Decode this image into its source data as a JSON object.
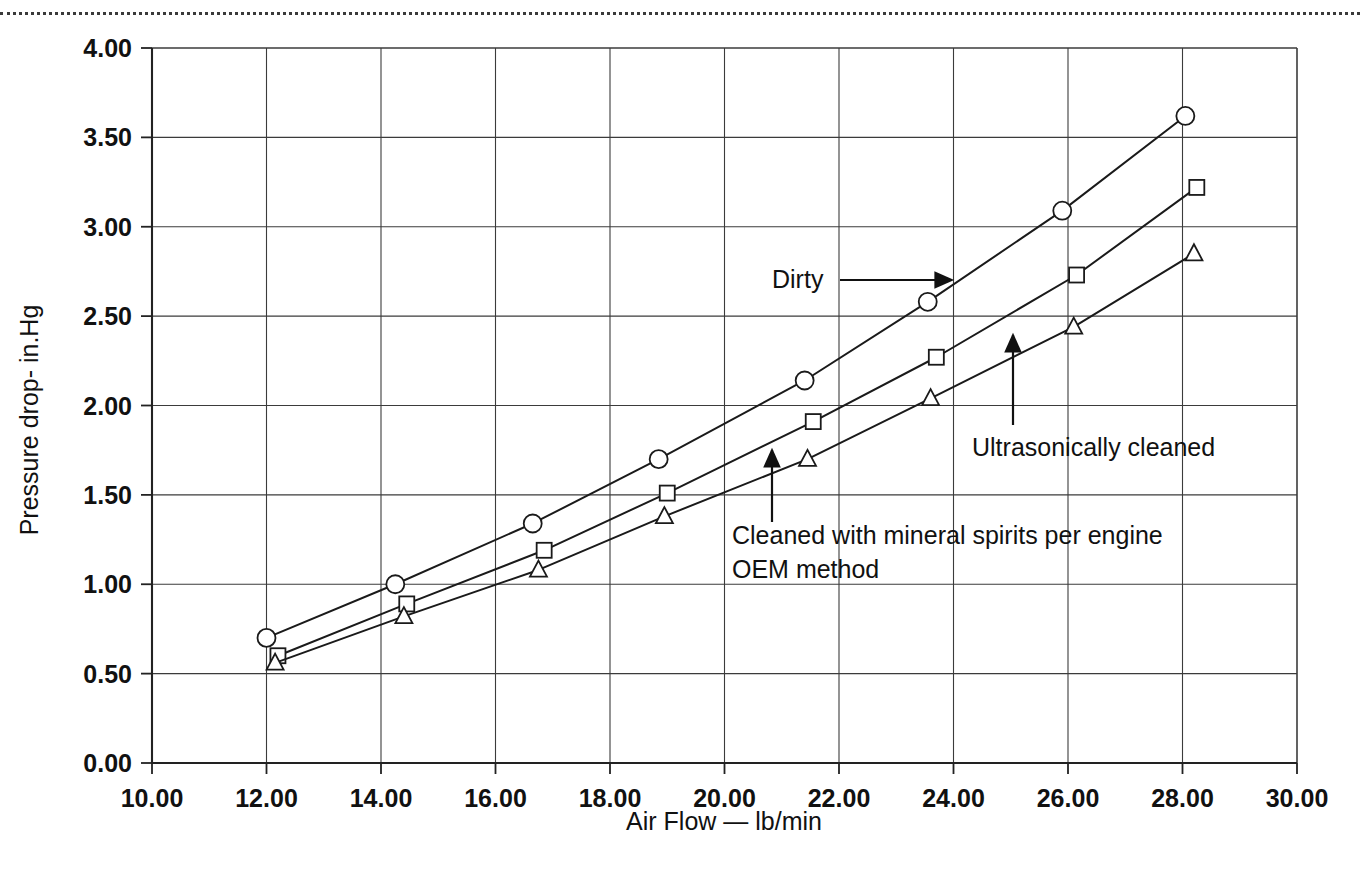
{
  "page": {
    "top_rule": "dotted-separator"
  },
  "chart_data": {
    "type": "line",
    "title": "",
    "xlabel": "Air Flow — lb/min",
    "ylabel": "Pressure drop- in.Hg",
    "xlim": [
      10.0,
      30.0
    ],
    "ylim": [
      0.0,
      4.0
    ],
    "xticks": [
      "10.00",
      "12.00",
      "14.00",
      "16.00",
      "18.00",
      "20.00",
      "22.00",
      "24.00",
      "26.00",
      "28.00",
      "30.00"
    ],
    "yticks": [
      "0.00",
      "0.50",
      "1.00",
      "1.50",
      "2.00",
      "2.50",
      "3.00",
      "3.50",
      "4.00"
    ],
    "xtick_values": [
      10,
      12,
      14,
      16,
      18,
      20,
      22,
      24,
      26,
      28,
      30
    ],
    "ytick_values": [
      0.0,
      0.5,
      1.0,
      1.5,
      2.0,
      2.5,
      3.0,
      3.5,
      4.0
    ],
    "grid": true,
    "legend_position": "inline-annotations",
    "series": [
      {
        "name": "Dirty",
        "marker": "circle",
        "color": "#1a1a1a",
        "x": [
          12.0,
          14.25,
          16.65,
          18.85,
          21.4,
          23.55,
          25.9,
          28.05
        ],
        "y": [
          0.7,
          1.0,
          1.34,
          1.7,
          2.14,
          2.58,
          3.09,
          3.62
        ]
      },
      {
        "name": "Cleaned with mineral spirits per engine OEM method",
        "marker": "square",
        "color": "#1a1a1a",
        "x": [
          12.2,
          14.45,
          16.85,
          19.0,
          21.55,
          23.7,
          26.15,
          28.25
        ],
        "y": [
          0.6,
          0.89,
          1.19,
          1.51,
          1.91,
          2.27,
          2.73,
          3.22
        ]
      },
      {
        "name": "Ultrasonically cleaned",
        "marker": "triangle",
        "color": "#1a1a1a",
        "x": [
          12.15,
          14.4,
          16.75,
          18.95,
          21.45,
          23.6,
          26.1,
          28.2
        ],
        "y": [
          0.56,
          0.82,
          1.08,
          1.38,
          1.7,
          2.04,
          2.44,
          2.85
        ]
      }
    ],
    "annotations": [
      {
        "id": "dirty",
        "text": "Dirty",
        "text_x": 772,
        "text_y": 288,
        "arrow": {
          "x1": 840,
          "y1": 280,
          "x2": 952,
          "y2": 280,
          "head": "right"
        }
      },
      {
        "id": "ultrasonically-cleaned",
        "text": "Ultrasonically cleaned",
        "text_x": 972,
        "text_y": 456,
        "arrow": {
          "x1": 1013,
          "y1": 425,
          "x2": 1013,
          "y2": 335,
          "head": "up"
        }
      },
      {
        "id": "mineral-spirits-line1",
        "text": "Cleaned with mineral spirits per engine",
        "text_x": 732,
        "text_y": 544,
        "arrow": {
          "x1": 772,
          "y1": 522,
          "x2": 772,
          "y2": 450,
          "head": "up"
        }
      },
      {
        "id": "mineral-spirits-line2",
        "text": "OEM method",
        "text_x": 732,
        "text_y": 578,
        "arrow": null
      }
    ]
  }
}
